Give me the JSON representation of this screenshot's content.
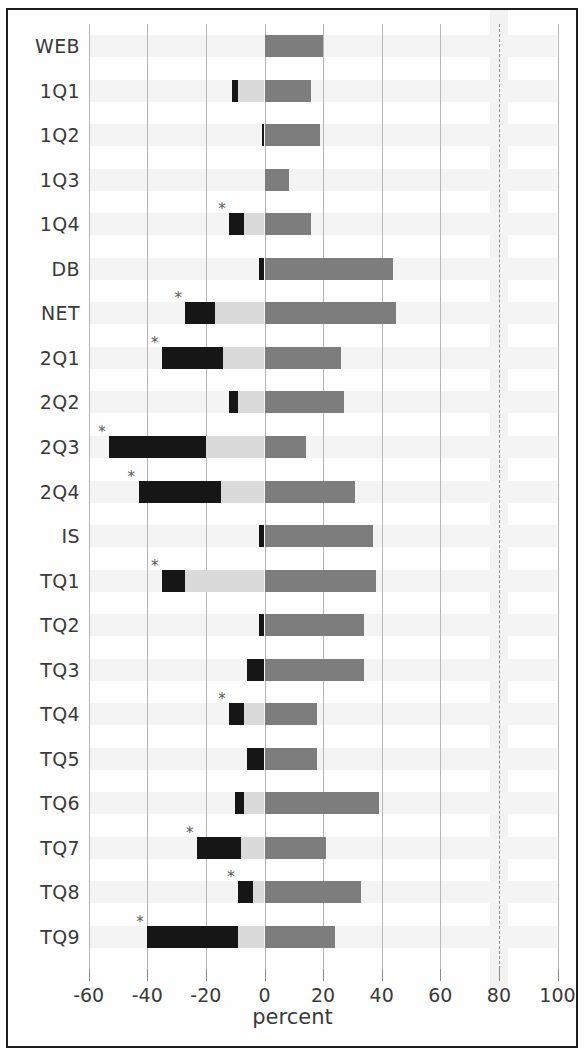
{
  "chart_data": {
    "type": "bar",
    "orientation": "horizontal",
    "subtype": "stacked-diverging",
    "title": "",
    "xlabel": "percent",
    "ylabel": "",
    "xlim": [
      -65,
      105
    ],
    "xticks": [
      -60,
      -40,
      -20,
      0,
      20,
      40,
      60,
      80,
      100
    ],
    "xticklabels": [
      "-60",
      "-40",
      "-20",
      "0",
      "20",
      "40",
      "60",
      "80",
      "100"
    ],
    "grid": true,
    "legend": "none",
    "categories": [
      "WEB",
      "1Q1",
      "1Q2",
      "1Q3",
      "1Q4",
      "DB",
      "NET",
      "2Q1",
      "2Q2",
      "2Q3",
      "2Q4",
      "IS",
      "TQ1",
      "TQ2",
      "TQ3",
      "TQ4",
      "TQ5",
      "TQ6",
      "TQ7",
      "TQ8",
      "TQ9"
    ],
    "series": [
      {
        "name": "negative-black",
        "color": "#161616",
        "values": [
          0,
          -11,
          -1,
          0,
          -12,
          -2,
          -27,
          -35,
          -12,
          -53,
          -43,
          -2,
          -35,
          -2,
          -6,
          -12,
          -6,
          -10,
          -23,
          -9,
          -40
        ]
      },
      {
        "name": "negative-light",
        "color": "#dadada",
        "values": [
          0,
          -9,
          0,
          0,
          -7,
          0,
          -17,
          -14,
          -9,
          -20,
          -15,
          0,
          -27,
          0,
          0,
          -7,
          0,
          -7,
          -8,
          -4,
          -9
        ]
      },
      {
        "name": "positive-dark",
        "color": "#7d7d7d",
        "values": [
          20,
          16,
          19,
          8.5,
          16,
          44,
          45,
          26,
          27,
          14,
          31,
          37,
          38,
          34,
          34,
          18,
          18,
          39,
          21,
          33,
          24
        ]
      }
    ],
    "significance_marked": [
      "1Q4",
      "NET",
      "2Q1",
      "2Q3",
      "2Q4",
      "TQ1",
      "TQ4",
      "TQ7",
      "TQ8",
      "TQ9"
    ],
    "significance_marker": "*",
    "colors": {
      "black_segment": "#161616",
      "light_segment": "#dadada",
      "dark_segment": "#7d7d7d",
      "gridline": "#b6b6b6",
      "frame": "#1d1d1d",
      "text": "#3a3a3a"
    }
  }
}
